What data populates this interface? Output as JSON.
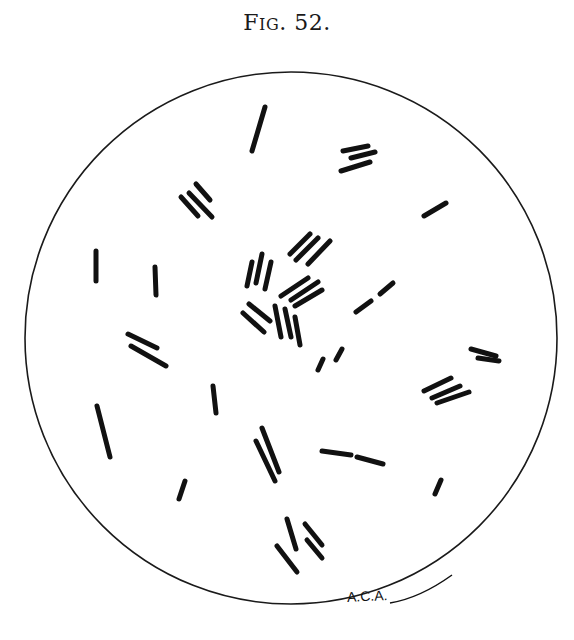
{
  "figure": {
    "caption_prefix": "F",
    "caption_smallcaps": "IG",
    "caption_number": ". 52.",
    "signature": "A.C.A."
  },
  "field": {
    "circle": {
      "cx": 291,
      "cy": 338,
      "r": 266,
      "stroke": "#1a1a1a"
    },
    "rod_color": "#111111",
    "rods": [
      {
        "x1": 265,
        "y1": 107,
        "x2": 252,
        "y2": 151,
        "w": 5
      },
      {
        "x1": 343,
        "y1": 151,
        "x2": 368,
        "y2": 146,
        "w": 5
      },
      {
        "x1": 351,
        "y1": 158,
        "x2": 375,
        "y2": 152,
        "w": 5
      },
      {
        "x1": 341,
        "y1": 171,
        "x2": 370,
        "y2": 162,
        "w": 5
      },
      {
        "x1": 424,
        "y1": 216,
        "x2": 446,
        "y2": 203,
        "w": 5
      },
      {
        "x1": 196,
        "y1": 184,
        "x2": 210,
        "y2": 200,
        "w": 5
      },
      {
        "x1": 189,
        "y1": 193,
        "x2": 212,
        "y2": 217,
        "w": 5
      },
      {
        "x1": 181,
        "y1": 197,
        "x2": 198,
        "y2": 216,
        "w": 5
      },
      {
        "x1": 96,
        "y1": 251,
        "x2": 96,
        "y2": 281,
        "w": 5
      },
      {
        "x1": 155,
        "y1": 267,
        "x2": 156,
        "y2": 295,
        "w": 5
      },
      {
        "x1": 290,
        "y1": 254,
        "x2": 310,
        "y2": 234,
        "w": 5
      },
      {
        "x1": 296,
        "y1": 260,
        "x2": 318,
        "y2": 238,
        "w": 5
      },
      {
        "x1": 308,
        "y1": 264,
        "x2": 330,
        "y2": 241,
        "w": 5
      },
      {
        "x1": 247,
        "y1": 286,
        "x2": 252,
        "y2": 262,
        "w": 5
      },
      {
        "x1": 256,
        "y1": 283,
        "x2": 262,
        "y2": 254,
        "w": 5
      },
      {
        "x1": 265,
        "y1": 289,
        "x2": 271,
        "y2": 262,
        "w": 5
      },
      {
        "x1": 281,
        "y1": 296,
        "x2": 308,
        "y2": 278,
        "w": 5
      },
      {
        "x1": 291,
        "y1": 300,
        "x2": 318,
        "y2": 282,
        "w": 5
      },
      {
        "x1": 295,
        "y1": 306,
        "x2": 322,
        "y2": 290,
        "w": 5
      },
      {
        "x1": 249,
        "y1": 304,
        "x2": 270,
        "y2": 321,
        "w": 5
      },
      {
        "x1": 243,
        "y1": 313,
        "x2": 264,
        "y2": 332,
        "w": 5
      },
      {
        "x1": 275,
        "y1": 306,
        "x2": 281,
        "y2": 337,
        "w": 5
      },
      {
        "x1": 285,
        "y1": 309,
        "x2": 291,
        "y2": 337,
        "w": 5
      },
      {
        "x1": 295,
        "y1": 317,
        "x2": 300,
        "y2": 345,
        "w": 5
      },
      {
        "x1": 356,
        "y1": 312,
        "x2": 371,
        "y2": 301,
        "w": 5
      },
      {
        "x1": 380,
        "y1": 294,
        "x2": 393,
        "y2": 283,
        "w": 5
      },
      {
        "x1": 318,
        "y1": 370,
        "x2": 323,
        "y2": 359,
        "w": 5
      },
      {
        "x1": 336,
        "y1": 360,
        "x2": 342,
        "y2": 349,
        "w": 5
      },
      {
        "x1": 128,
        "y1": 334,
        "x2": 157,
        "y2": 348,
        "w": 5
      },
      {
        "x1": 131,
        "y1": 346,
        "x2": 166,
        "y2": 366,
        "w": 5
      },
      {
        "x1": 471,
        "y1": 349,
        "x2": 496,
        "y2": 356,
        "w": 5
      },
      {
        "x1": 478,
        "y1": 358,
        "x2": 499,
        "y2": 361,
        "w": 5
      },
      {
        "x1": 424,
        "y1": 391,
        "x2": 451,
        "y2": 378,
        "w": 5
      },
      {
        "x1": 432,
        "y1": 398,
        "x2": 460,
        "y2": 386,
        "w": 5
      },
      {
        "x1": 437,
        "y1": 403,
        "x2": 469,
        "y2": 392,
        "w": 5
      },
      {
        "x1": 97,
        "y1": 406,
        "x2": 110,
        "y2": 457,
        "w": 5
      },
      {
        "x1": 213,
        "y1": 386,
        "x2": 216,
        "y2": 413,
        "w": 5
      },
      {
        "x1": 262,
        "y1": 428,
        "x2": 279,
        "y2": 472,
        "w": 5
      },
      {
        "x1": 256,
        "y1": 441,
        "x2": 275,
        "y2": 481,
        "w": 5
      },
      {
        "x1": 322,
        "y1": 451,
        "x2": 351,
        "y2": 455,
        "w": 5
      },
      {
        "x1": 357,
        "y1": 457,
        "x2": 383,
        "y2": 464,
        "w": 5
      },
      {
        "x1": 185,
        "y1": 481,
        "x2": 179,
        "y2": 499,
        "w": 5
      },
      {
        "x1": 441,
        "y1": 480,
        "x2": 435,
        "y2": 494,
        "w": 5
      },
      {
        "x1": 287,
        "y1": 519,
        "x2": 296,
        "y2": 549,
        "w": 5
      },
      {
        "x1": 305,
        "y1": 524,
        "x2": 322,
        "y2": 545,
        "w": 5
      },
      {
        "x1": 307,
        "y1": 540,
        "x2": 322,
        "y2": 558,
        "w": 5
      },
      {
        "x1": 277,
        "y1": 546,
        "x2": 297,
        "y2": 572,
        "w": 5
      }
    ]
  }
}
